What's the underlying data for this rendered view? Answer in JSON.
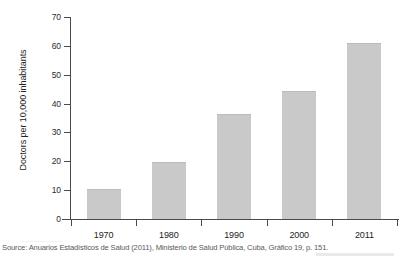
{
  "chart_data": {
    "type": "bar",
    "title": "",
    "subtitle": "",
    "xlabel": "",
    "ylabel": "Doctors per 10,000 inhabitants",
    "categories": [
      "1970",
      "1980",
      "1990",
      "2000",
      "2011"
    ],
    "values": [
      10,
      19.5,
      36,
      44,
      60.5
    ],
    "series": [
      {
        "name": "Doctors per 10,000 inhabitants",
        "values": [
          10,
          19.5,
          36,
          44,
          60.5
        ]
      }
    ],
    "ylim": [
      0,
      70
    ],
    "yticks": [
      0,
      10,
      20,
      30,
      40,
      50,
      60,
      70
    ],
    "ytick_labels": [
      "0",
      "10",
      "20",
      "30",
      "40",
      "50",
      "60",
      "70"
    ],
    "grid": false,
    "legend": false,
    "legend_position": "none",
    "bar_color": "#c9c9c9",
    "axis_color": "#4a4a4a",
    "background_color": "#ffffff"
  },
  "figure": {
    "source_note": "Source: Anuarios Estadísticos de Salud (2011), Ministerio de Salud Pública, Cuba, Gráfico 19, p. 151."
  }
}
